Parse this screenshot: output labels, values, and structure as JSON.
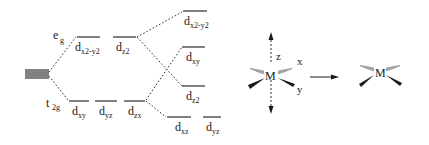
{
  "diagram": {
    "degenerate_set": {
      "label": "",
      "count": 5
    },
    "octahedral": {
      "eg": {
        "label": "e",
        "sub": "g",
        "orbitals": [
          {
            "name": "d",
            "sub": "x2-y2"
          },
          {
            "name": "d",
            "sub": "z2"
          }
        ]
      },
      "t2g": {
        "label": "t",
        "sub": "2g",
        "orbitals": [
          {
            "name": "d",
            "sub": "xy"
          },
          {
            "name": "d",
            "sub": "yz"
          },
          {
            "name": "d",
            "sub": "zx"
          }
        ]
      }
    },
    "square_planar": {
      "levels": [
        {
          "name": "d",
          "sub": "x2-y2"
        },
        {
          "name": "d",
          "sub": "xy"
        },
        {
          "name": "d",
          "sub": "z2"
        },
        {
          "name": "d",
          "sub": "xz"
        },
        {
          "name": "d",
          "sub": "yz"
        }
      ]
    },
    "octahedral_complex": {
      "center": "M",
      "axes": {
        "z": "z",
        "x": "x",
        "y": "y"
      }
    },
    "square_planar_complex": {
      "center": "M"
    },
    "colors": {
      "line": "#1a1a1a",
      "background": "#ffffff"
    }
  }
}
